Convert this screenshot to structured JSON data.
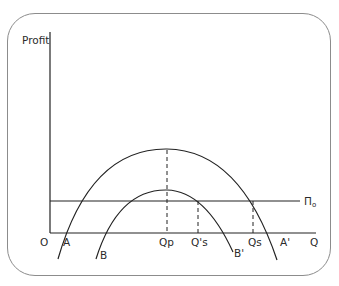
{
  "diagram": {
    "y_axis_label": "Profit",
    "x_axis_label": "Q",
    "origin_label": "O",
    "curves": [
      {
        "name": "outer-profit-curve",
        "start_label": "A",
        "end_label": "A'"
      },
      {
        "name": "inner-profit-curve",
        "start_label": "B",
        "end_label": "B'"
      }
    ],
    "constraint_line_label": "Π",
    "constraint_line_subscript": "o",
    "x_marks": {
      "qp": "Qp",
      "qs_prime": "Q's",
      "qs": "Qs"
    },
    "colors": {
      "line": "#222222",
      "frame": "#8c8c8c"
    }
  }
}
